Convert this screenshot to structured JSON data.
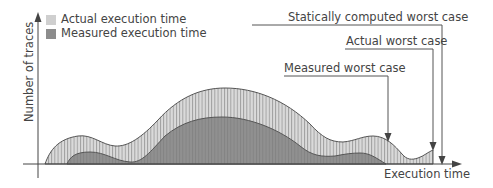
{
  "legend": {
    "items": [
      {
        "label": "Actual execution time",
        "color": "#cfcfcf"
      },
      {
        "label": "Measured execution time",
        "color": "#8c8c8c"
      }
    ]
  },
  "axes": {
    "ylabel": "Number of traces",
    "xlabel": "Execution time"
  },
  "annotations": {
    "static_wc": "Statically computed worst case",
    "actual_wc": "Actual worst case",
    "measured_wc": "Measured worst case"
  },
  "colors": {
    "actual_fill": "#d4d4d4",
    "measured_fill": "#8e8e8e",
    "stroke": "#555555",
    "text": "#444444"
  }
}
